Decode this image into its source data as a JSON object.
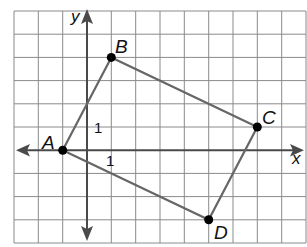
{
  "diagram": {
    "type": "coordinate-plane-quadrilateral",
    "axes": {
      "x_label": "x",
      "y_label": "y"
    },
    "unit_labels": {
      "y_unit": "1",
      "x_unit": "1"
    },
    "grid": {
      "x_min": -3,
      "x_max": 9,
      "y_min": -4,
      "y_max": 6
    },
    "points": [
      {
        "name": "A",
        "x": -1,
        "y": 0
      },
      {
        "name": "B",
        "x": 1,
        "y": 4
      },
      {
        "name": "C",
        "x": 7,
        "y": 1
      },
      {
        "name": "D",
        "x": 5,
        "y": -3
      }
    ],
    "polygon": [
      "A",
      "B",
      "C",
      "D"
    ],
    "colors": {
      "grid": "#8a8a8a",
      "axis": "#4a4a4a",
      "edge": "#666666",
      "point": "#000000"
    }
  }
}
